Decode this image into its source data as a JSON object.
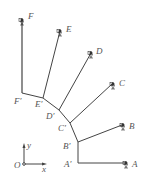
{
  "diagram": {
    "type": "mechanism-linkage",
    "colors": {
      "line": "#444444",
      "label": "#555555",
      "support": "#333333"
    },
    "points": {
      "A": {
        "label": "A",
        "x": 128,
        "y": 163
      },
      "B": {
        "label": "B",
        "x": 124,
        "y": 125
      },
      "C": {
        "label": "C",
        "x": 114,
        "y": 83
      },
      "D": {
        "label": "D",
        "x": 92,
        "y": 52
      },
      "E": {
        "label": "E",
        "x": 61,
        "y": 30
      },
      "F": {
        "label": "F",
        "x": 22,
        "y": 18
      },
      "A1": {
        "label": "A′",
        "x": 78,
        "y": 163
      },
      "B1": {
        "label": "B′",
        "x": 78,
        "y": 142
      },
      "C1": {
        "label": "C′",
        "x": 70,
        "y": 123
      },
      "D1": {
        "label": "D′",
        "x": 59,
        "y": 110
      },
      "E1": {
        "label": "E′",
        "x": 43,
        "y": 98
      },
      "F1": {
        "label": "F′",
        "x": 22,
        "y": 93
      }
    },
    "axes": {
      "origin_label": "O",
      "x_label": "x",
      "y_label": "y"
    }
  }
}
